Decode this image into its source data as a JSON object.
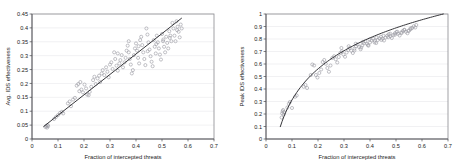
{
  "figure": {
    "background": "#ffffff",
    "point_color": "#9a9aa2",
    "line_color": "#2b2b2f",
    "grid_color": "#e3e3e6"
  },
  "chart_data": [
    {
      "type": "scatter",
      "panel": "left",
      "title": "",
      "xlabel": "Fraction of intercepted threats",
      "ylabel": "Avg. IDS effectiveness",
      "xlim": [
        0,
        0.7
      ],
      "ylim": [
        0,
        0.45
      ],
      "xticks": [
        "0",
        "0.1",
        "0.2",
        "0.3",
        "0.4",
        "0.5",
        "0.6",
        "0.7"
      ],
      "xtick_values": [
        0,
        0.1,
        0.2,
        0.3,
        0.4,
        0.5,
        0.6,
        0.7
      ],
      "yticks": [
        "0",
        "0.05",
        "0.1",
        "0.15",
        "0.2",
        "0.25",
        "0.3",
        "0.35",
        "0.4",
        "0.45"
      ],
      "ytick_values": [
        0,
        0.05,
        0.1,
        0.15,
        0.2,
        0.25,
        0.3,
        0.35,
        0.4,
        0.45
      ],
      "grid": "horizontal",
      "legend": "none",
      "marker": "open-circle",
      "fit": {
        "kind": "linear",
        "slope": 0.735,
        "intercept": 0.012,
        "x_start": 0.045,
        "x_end": 0.575
      },
      "points": [
        [
          0.052,
          0.043
        ],
        [
          0.055,
          0.047
        ],
        [
          0.058,
          0.041
        ],
        [
          0.06,
          0.05
        ],
        [
          0.062,
          0.046
        ],
        [
          0.085,
          0.072
        ],
        [
          0.092,
          0.079
        ],
        [
          0.1,
          0.086
        ],
        [
          0.108,
          0.094
        ],
        [
          0.115,
          0.098
        ],
        [
          0.12,
          0.092
        ],
        [
          0.138,
          0.128
        ],
        [
          0.145,
          0.135
        ],
        [
          0.15,
          0.118
        ],
        [
          0.158,
          0.142
        ],
        [
          0.165,
          0.148
        ],
        [
          0.172,
          0.192
        ],
        [
          0.178,
          0.198
        ],
        [
          0.182,
          0.172
        ],
        [
          0.186,
          0.205
        ],
        [
          0.19,
          0.178
        ],
        [
          0.196,
          0.168
        ],
        [
          0.202,
          0.196
        ],
        [
          0.208,
          0.182
        ],
        [
          0.212,
          0.16
        ],
        [
          0.218,
          0.158
        ],
        [
          0.222,
          0.17
        ],
        [
          0.228,
          0.188
        ],
        [
          0.235,
          0.212
        ],
        [
          0.24,
          0.224
        ],
        [
          0.245,
          0.198
        ],
        [
          0.252,
          0.218
        ],
        [
          0.258,
          0.228
        ],
        [
          0.262,
          0.205
        ],
        [
          0.268,
          0.236
        ],
        [
          0.272,
          0.248
        ],
        [
          0.278,
          0.23
        ],
        [
          0.285,
          0.258
        ],
        [
          0.29,
          0.242
        ],
        [
          0.295,
          0.222
        ],
        [
          0.3,
          0.268
        ],
        [
          0.305,
          0.276
        ],
        [
          0.31,
          0.252
        ],
        [
          0.316,
          0.312
        ],
        [
          0.32,
          0.288
        ],
        [
          0.325,
          0.264
        ],
        [
          0.33,
          0.246
        ],
        [
          0.336,
          0.272
        ],
        [
          0.34,
          0.284
        ],
        [
          0.345,
          0.302
        ],
        [
          0.35,
          0.258
        ],
        [
          0.356,
          0.276
        ],
        [
          0.36,
          0.292
        ],
        [
          0.364,
          0.318
        ],
        [
          0.368,
          0.336
        ],
        [
          0.372,
          0.312
        ],
        [
          0.376,
          0.288
        ],
        [
          0.38,
          0.268
        ],
        [
          0.384,
          0.236
        ],
        [
          0.388,
          0.248
        ],
        [
          0.392,
          0.302
        ],
        [
          0.396,
          0.326
        ],
        [
          0.4,
          0.344
        ],
        [
          0.404,
          0.318
        ],
        [
          0.408,
          0.292
        ],
        [
          0.412,
          0.272
        ],
        [
          0.416,
          0.356
        ],
        [
          0.42,
          0.368
        ],
        [
          0.424,
          0.338
        ],
        [
          0.428,
          0.312
        ],
        [
          0.432,
          0.288
        ],
        [
          0.436,
          0.266
        ],
        [
          0.44,
          0.398
        ],
        [
          0.444,
          0.376
        ],
        [
          0.448,
          0.348
        ],
        [
          0.452,
          0.322
        ],
        [
          0.456,
          0.298
        ],
        [
          0.46,
          0.278
        ],
        [
          0.464,
          0.262
        ],
        [
          0.468,
          0.356
        ],
        [
          0.472,
          0.332
        ],
        [
          0.476,
          0.308
        ],
        [
          0.48,
          0.372
        ],
        [
          0.484,
          0.348
        ],
        [
          0.488,
          0.326
        ],
        [
          0.492,
          0.304
        ],
        [
          0.496,
          0.286
        ],
        [
          0.5,
          0.378
        ],
        [
          0.504,
          0.352
        ],
        [
          0.508,
          0.332
        ],
        [
          0.512,
          0.312
        ],
        [
          0.516,
          0.368
        ],
        [
          0.52,
          0.346
        ],
        [
          0.524,
          0.326
        ],
        [
          0.528,
          0.388
        ],
        [
          0.532,
          0.372
        ],
        [
          0.536,
          0.352
        ],
        [
          0.54,
          0.418
        ],
        [
          0.544,
          0.398
        ],
        [
          0.548,
          0.372
        ],
        [
          0.552,
          0.352
        ],
        [
          0.556,
          0.424
        ],
        [
          0.56,
          0.404
        ],
        [
          0.564,
          0.386
        ],
        [
          0.568,
          0.366
        ],
        [
          0.572,
          0.412
        ],
        [
          0.576,
          0.398
        ],
        [
          0.33,
          0.308
        ],
        [
          0.372,
          0.352
        ],
        [
          0.41,
          0.334
        ],
        [
          0.445,
          0.316
        ],
        [
          0.478,
          0.342
        ],
        [
          0.505,
          0.358
        ],
        [
          0.53,
          0.364
        ],
        [
          0.558,
          0.392
        ]
      ]
    },
    {
      "type": "scatter",
      "panel": "right",
      "title": "",
      "xlabel": "Fraction of intercepted threats",
      "ylabel": "Peak IDS effectiveness",
      "xlim": [
        0,
        0.7
      ],
      "ylim": [
        0,
        1
      ],
      "xticks": [
        "0",
        "0.1",
        "0.2",
        "0.3",
        "0.4",
        "0.5",
        "0.6",
        "0.7"
      ],
      "xtick_values": [
        0,
        0.1,
        0.2,
        0.3,
        0.4,
        0.5,
        0.6,
        0.7
      ],
      "yticks": [
        "0",
        "0.1",
        "0.2",
        "0.3",
        "0.4",
        "0.5",
        "0.6",
        "0.7",
        "0.8",
        "0.9",
        "1"
      ],
      "ytick_values": [
        0,
        0.1,
        0.2,
        0.3,
        0.4,
        0.5,
        0.6,
        0.7,
        0.8,
        0.9,
        1
      ],
      "grid": "horizontal",
      "legend": "none",
      "marker": "open-circle",
      "fit": {
        "kind": "logarithmic",
        "a": 0.358,
        "b": 1.0,
        "x_start": 0.055,
        "x_end": 0.682
      },
      "points": [
        [
          0.06,
          0.172
        ],
        [
          0.062,
          0.205
        ],
        [
          0.064,
          0.222
        ],
        [
          0.066,
          0.232
        ],
        [
          0.068,
          0.196
        ],
        [
          0.07,
          0.215
        ],
        [
          0.082,
          0.252
        ],
        [
          0.088,
          0.282
        ],
        [
          0.092,
          0.296
        ],
        [
          0.1,
          0.248
        ],
        [
          0.112,
          0.338
        ],
        [
          0.118,
          0.348
        ],
        [
          0.145,
          0.418
        ],
        [
          0.152,
          0.432
        ],
        [
          0.158,
          0.408
        ],
        [
          0.172,
          0.512
        ],
        [
          0.178,
          0.596
        ],
        [
          0.185,
          0.588
        ],
        [
          0.192,
          0.512
        ],
        [
          0.198,
          0.492
        ],
        [
          0.205,
          0.528
        ],
        [
          0.212,
          0.556
        ],
        [
          0.218,
          0.616
        ],
        [
          0.224,
          0.632
        ],
        [
          0.23,
          0.602
        ],
        [
          0.236,
          0.568
        ],
        [
          0.242,
          0.538
        ],
        [
          0.248,
          0.588
        ],
        [
          0.255,
          0.648
        ],
        [
          0.262,
          0.662
        ],
        [
          0.268,
          0.638
        ],
        [
          0.274,
          0.612
        ],
        [
          0.28,
          0.656
        ],
        [
          0.286,
          0.688
        ],
        [
          0.292,
          0.702
        ],
        [
          0.298,
          0.676
        ],
        [
          0.304,
          0.658
        ],
        [
          0.31,
          0.692
        ],
        [
          0.316,
          0.712
        ],
        [
          0.322,
          0.728
        ],
        [
          0.328,
          0.706
        ],
        [
          0.334,
          0.688
        ],
        [
          0.34,
          0.722
        ],
        [
          0.346,
          0.742
        ],
        [
          0.352,
          0.756
        ],
        [
          0.358,
          0.736
        ],
        [
          0.364,
          0.718
        ],
        [
          0.37,
          0.748
        ],
        [
          0.376,
          0.766
        ],
        [
          0.382,
          0.782
        ],
        [
          0.388,
          0.762
        ],
        [
          0.394,
          0.746
        ],
        [
          0.4,
          0.772
        ],
        [
          0.406,
          0.788
        ],
        [
          0.412,
          0.802
        ],
        [
          0.418,
          0.786
        ],
        [
          0.424,
          0.768
        ],
        [
          0.43,
          0.792
        ],
        [
          0.436,
          0.806
        ],
        [
          0.442,
          0.818
        ],
        [
          0.448,
          0.802
        ],
        [
          0.454,
          0.788
        ],
        [
          0.46,
          0.812
        ],
        [
          0.466,
          0.826
        ],
        [
          0.472,
          0.838
        ],
        [
          0.478,
          0.822
        ],
        [
          0.484,
          0.808
        ],
        [
          0.49,
          0.832
        ],
        [
          0.496,
          0.846
        ],
        [
          0.502,
          0.856
        ],
        [
          0.508,
          0.842
        ],
        [
          0.514,
          0.828
        ],
        [
          0.52,
          0.852
        ],
        [
          0.526,
          0.864
        ],
        [
          0.532,
          0.874
        ],
        [
          0.538,
          0.858
        ],
        [
          0.544,
          0.846
        ],
        [
          0.55,
          0.868
        ],
        [
          0.556,
          0.878
        ],
        [
          0.562,
          0.888
        ],
        [
          0.568,
          0.902
        ],
        [
          0.574,
          0.892
        ],
        [
          0.578,
          0.912
        ],
        [
          0.29,
          0.728
        ],
        [
          0.318,
          0.742
        ],
        [
          0.345,
          0.762
        ],
        [
          0.372,
          0.776
        ],
        [
          0.398,
          0.796
        ],
        [
          0.425,
          0.812
        ],
        [
          0.452,
          0.826
        ],
        [
          0.478,
          0.842
        ],
        [
          0.505,
          0.858
        ],
        [
          0.532,
          0.872
        ],
        [
          0.556,
          0.886
        ],
        [
          0.34,
          0.708
        ],
        [
          0.366,
          0.732
        ],
        [
          0.392,
          0.752
        ],
        [
          0.418,
          0.772
        ],
        [
          0.444,
          0.792
        ],
        [
          0.47,
          0.814
        ],
        [
          0.496,
          0.834
        ],
        [
          0.522,
          0.848
        ],
        [
          0.548,
          0.864
        ]
      ]
    }
  ]
}
